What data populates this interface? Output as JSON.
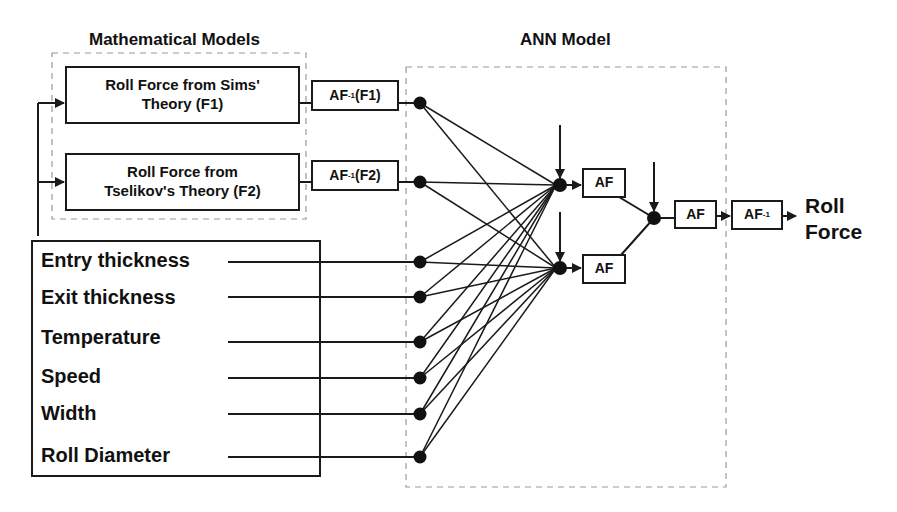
{
  "titles": {
    "math_models": "Mathematical Models",
    "ann_model": "ANN Model"
  },
  "math_boxes": [
    {
      "line1": "Roll Force from Sims'",
      "line2": "Theory (F1)"
    },
    {
      "line1": "Roll Force from",
      "line2": "Tselikov's Theory (F2)"
    }
  ],
  "inverse_af_boxes": [
    {
      "prefix": "AF",
      "sup": "-1",
      "suffix": "(F1)"
    },
    {
      "prefix": "AF",
      "sup": "-1",
      "suffix": "(F2)"
    }
  ],
  "inputs": [
    "Entry thickness",
    "Exit thickness",
    "Temperature",
    "Speed",
    "Width",
    "Roll Diameter"
  ],
  "hidden_af": [
    "AF",
    "AF"
  ],
  "output_af": "AF",
  "output_inverse": {
    "prefix": "AF",
    "sup": "-1"
  },
  "output": {
    "line1": "Roll",
    "line2": "Force"
  },
  "colors": {
    "stroke": "#1a1a1a",
    "dashed": "#999999",
    "background": "#ffffff"
  }
}
